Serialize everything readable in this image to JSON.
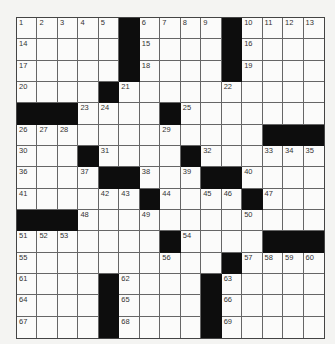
{
  "puzzle": {
    "rows": 15,
    "cols": 15,
    "colors": {
      "black": "#0d0d0d",
      "white": "#fbfbfa",
      "line": "#666666"
    },
    "grid": [
      [
        "1",
        "2",
        "3",
        "4",
        "5",
        "#",
        "6",
        "7",
        "8",
        "9",
        "#",
        "10",
        "11",
        "12",
        "13"
      ],
      [
        "14",
        "",
        "",
        "",
        "",
        "#",
        "15",
        "",
        "",
        "",
        "#",
        "16",
        "",
        "",
        ""
      ],
      [
        "17",
        "",
        "",
        "",
        "",
        "#",
        "18",
        "",
        "",
        "",
        "#",
        "19",
        "",
        "",
        ""
      ],
      [
        "20",
        "",
        "",
        "",
        "#",
        "21",
        "",
        "",
        "",
        "",
        "22",
        "",
        "",
        "",
        ""
      ],
      [
        "#",
        "#",
        "#",
        "23",
        "24",
        "",
        "",
        "#",
        "25",
        "",
        "",
        "",
        "",
        "",
        ""
      ],
      [
        "26",
        "27",
        "28",
        "",
        "",
        "",
        "",
        "29",
        "",
        "",
        "",
        "",
        "#",
        "#",
        "#"
      ],
      [
        "30",
        "",
        "",
        "#",
        "31",
        "",
        "",
        "",
        "#",
        "32",
        "",
        "",
        "33",
        "34",
        "35"
      ],
      [
        "36",
        "",
        "",
        "37",
        "#",
        "#",
        "38",
        "",
        "39",
        "#",
        "#",
        "40",
        "",
        "",
        ""
      ],
      [
        "41",
        "",
        "",
        "",
        "42",
        "43",
        "#",
        "44",
        "",
        "45",
        "46",
        "#",
        "47",
        "",
        ""
      ],
      [
        "#",
        "#",
        "#",
        "48",
        "",
        "",
        "49",
        "",
        "",
        "",
        "",
        "50",
        "",
        "",
        ""
      ],
      [
        "51",
        "52",
        "53",
        "",
        "",
        "",
        "",
        "#",
        "54",
        "",
        "",
        "",
        "#",
        "#",
        "#"
      ],
      [
        "55",
        "",
        "",
        "",
        "",
        "",
        "",
        "56",
        "",
        "",
        "#",
        "57",
        "58",
        "59",
        "60"
      ],
      [
        "61",
        "",
        "",
        "",
        "#",
        "62",
        "",
        "",
        "",
        "#",
        "63",
        "",
        "",
        "",
        ""
      ],
      [
        "64",
        "",
        "",
        "",
        "#",
        "65",
        "",
        "",
        "",
        "#",
        "66",
        "",
        "",
        "",
        ""
      ],
      [
        "67",
        "",
        "",
        "",
        "#",
        "68",
        "",
        "",
        "",
        "#",
        "69",
        "",
        "",
        "",
        ""
      ]
    ]
  }
}
